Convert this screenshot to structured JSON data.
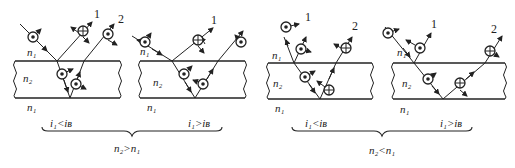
{
  "panels": [
    {
      "id": "p1",
      "ray1_label": "1",
      "ray2_label": "2",
      "medium_top": "n₁",
      "medium_slab": "n₂",
      "medium_bottom": "n₁"
    },
    {
      "id": "p2",
      "ray1_label": "1",
      "ray2_label": "2",
      "medium_top": "n₁",
      "medium_slab": "n₂",
      "medium_bottom": "n₁"
    },
    {
      "id": "p3",
      "ray1_label": "1",
      "ray2_label": "2",
      "medium_top": "n₁",
      "medium_slab": "n₂",
      "medium_bottom": "n₁"
    },
    {
      "id": "p4",
      "ray1_label": "1",
      "ray2_label": "2",
      "medium_top": "n₁",
      "medium_slab": "n₂",
      "medium_bottom": "n₁"
    }
  ],
  "groups": [
    {
      "left_condition": "i₁<iʙ",
      "right_condition": "i₁>iʙ",
      "relation": "n₂>n₁"
    },
    {
      "left_condition": "i₁<iʙ",
      "right_condition": "i₁>iʙ",
      "relation": "n₂<n₁"
    }
  ],
  "labels": {
    "n": "n",
    "sub1": "1",
    "sub2": "2",
    "i": "i",
    "iB": "B",
    "lt": "<",
    "gt": ">"
  },
  "symbols": {
    "dot": "polarization-perpendicular-dot-icon",
    "cross": "polarization-cross-icon"
  },
  "colors": {
    "ink": "#222222",
    "background": "#ffffff"
  }
}
